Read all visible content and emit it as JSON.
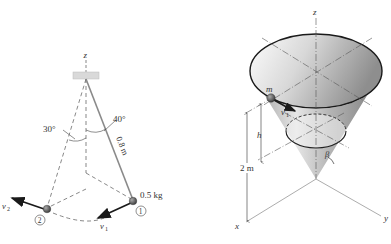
{
  "left_figure": {
    "axis_label": "z",
    "angle_1": "30°",
    "angle_2": "40°",
    "cord_length": "0.8 m",
    "mass": "0.5 kg",
    "position_1": "1",
    "position_2": "2",
    "velocity_1": "v",
    "velocity_1_sub": "1",
    "velocity_2": "v",
    "velocity_2_sub": "2"
  },
  "right_figure": {
    "axis_z": "z",
    "axis_x": "x",
    "axis_y": "y",
    "mass_label": "m",
    "velocity": "v",
    "velocity_sub": "1",
    "height_label": "h",
    "total_height": "2 m",
    "angle_label": "β"
  },
  "colors": {
    "cord": "#8a8a8a",
    "dashed": "#555555",
    "mass": "#555555",
    "cone_dark": "#8c8c8c",
    "cone_light": "#f2f2f2",
    "rim": "#1a1a1a",
    "plate": "#d9d9d9"
  }
}
